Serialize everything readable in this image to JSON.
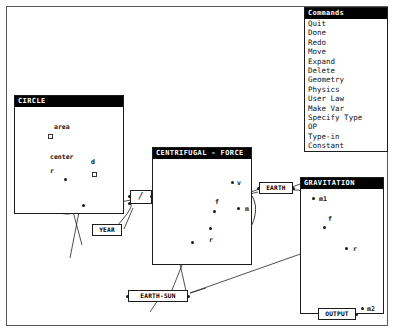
{
  "app": {
    "background": "#ffffff",
    "frame_color": "#5a5a5a",
    "title_bar_color": "#000000",
    "title_text_color": "#ffffff"
  },
  "menu": {
    "title": "Commands",
    "items": [
      {
        "label": "Quit"
      },
      {
        "label": "Done"
      },
      {
        "label": "Redo"
      },
      {
        "label": "Move"
      },
      {
        "label": "Expand"
      },
      {
        "label": "Delete"
      },
      {
        "label": "Geometry"
      },
      {
        "label": "Physics"
      },
      {
        "label": "User Law"
      },
      {
        "label": "Make Var"
      },
      {
        "label": "Specify Type"
      },
      {
        "label": "OP"
      },
      {
        "label": "Type-in"
      },
      {
        "label": "Constant"
      }
    ]
  },
  "windows": {
    "circle": {
      "title": "CIRCLE",
      "labels": {
        "area": "area",
        "center": "center",
        "diameter": "d",
        "radius": "r",
        "circumference": "c"
      }
    },
    "centrifugal_force": {
      "title": "CENTRIFUGAL - FORCE",
      "labels": {
        "velocity": "v",
        "force": "f",
        "mass": "m",
        "radius": "r"
      }
    },
    "gravitation": {
      "title": "GRAVITATION",
      "labels": {
        "mass1": "m1",
        "force": "f",
        "radius": "r",
        "mass2": "m2"
      }
    }
  },
  "nodes": {
    "year": "YEAR",
    "earth": "EARTH",
    "earth_sun": "EARTH-SUN",
    "output": "OUTPUT",
    "divide_op": "/"
  }
}
